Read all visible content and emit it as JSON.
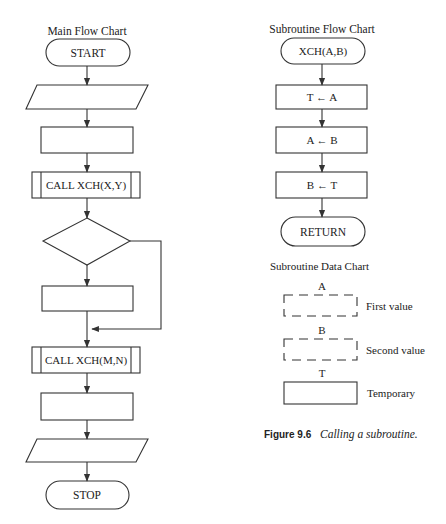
{
  "main_chart": {
    "title": "Main Flow Chart",
    "nodes": [
      {
        "type": "terminator",
        "label": "START"
      },
      {
        "type": "input-output",
        "label": ""
      },
      {
        "type": "process",
        "label": ""
      },
      {
        "type": "predefined-process",
        "label": "CALL XCH(X,Y)"
      },
      {
        "type": "decision",
        "label": ""
      },
      {
        "type": "process",
        "label": ""
      },
      {
        "type": "predefined-process",
        "label": "CALL XCH(M,N)"
      },
      {
        "type": "process",
        "label": ""
      },
      {
        "type": "input-output",
        "label": ""
      },
      {
        "type": "terminator",
        "label": "STOP"
      }
    ]
  },
  "subroutine_chart": {
    "title": "Subroutine Flow Chart",
    "nodes": [
      {
        "type": "terminator",
        "label": "XCH(A,B)"
      },
      {
        "type": "process",
        "label": "T ← A"
      },
      {
        "type": "process",
        "label": "A ← B"
      },
      {
        "type": "process",
        "label": "B ← T"
      },
      {
        "type": "terminator",
        "label": "RETURN"
      }
    ]
  },
  "data_chart": {
    "title": "Subroutine Data Chart",
    "items": [
      {
        "name": "A",
        "description": "First value",
        "style": "dashed"
      },
      {
        "name": "B",
        "description": "Second value",
        "style": "dashed"
      },
      {
        "name": "T",
        "description": "Temporary",
        "style": "solid"
      }
    ]
  },
  "caption": {
    "figure_number": "Figure 9.6",
    "text": "Calling a subroutine."
  },
  "colors": {
    "line": "#333333",
    "text": "#222222",
    "background": "#ffffff"
  }
}
